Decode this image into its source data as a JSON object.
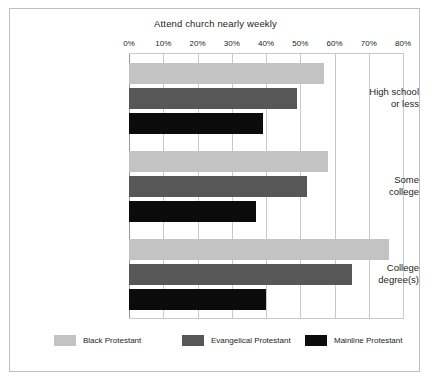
{
  "chart_data": {
    "type": "bar",
    "orientation": "horizontal",
    "title": "Attend church nearly weekly",
    "xlabel": "",
    "ylabel": "",
    "xlim": [
      0,
      80
    ],
    "xticks": [
      0,
      10,
      20,
      30,
      40,
      50,
      60,
      70,
      80
    ],
    "xtick_labels": [
      "0%",
      "10%",
      "20%",
      "30%",
      "40%",
      "50%",
      "60%",
      "70%",
      "80%"
    ],
    "grid": true,
    "legend_position": "bottom",
    "categories": [
      "High school or less",
      "Some college",
      "College degree(s)"
    ],
    "category_lines": [
      [
        "High school",
        "or less"
      ],
      [
        "Some",
        "college"
      ],
      [
        "College",
        "degree(s)"
      ]
    ],
    "series": [
      {
        "name": "Black Protestant",
        "color": "#c3c3c3",
        "values": [
          57,
          58,
          76
        ]
      },
      {
        "name": "Evangelical Protestant",
        "color": "#575757",
        "values": [
          49,
          52,
          65
        ]
      },
      {
        "name": "Mainline Protestant",
        "color": "#0b0b0b",
        "values": [
          39,
          37,
          40
        ]
      }
    ]
  },
  "legend": {
    "items": [
      {
        "label": "Black Protestant"
      },
      {
        "label": "Evangelical Protestant"
      },
      {
        "label": "Mainline Protestant"
      }
    ]
  }
}
